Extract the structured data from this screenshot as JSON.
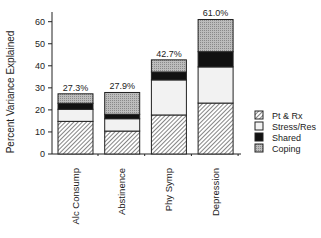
{
  "chart_data": {
    "type": "bar",
    "stacked": true,
    "title": "",
    "xlabel": "",
    "ylabel": "Percent Variance Explained",
    "ylim": [
      0,
      65
    ],
    "yticks": [
      0,
      10,
      20,
      30,
      40,
      50,
      60
    ],
    "ytick_labels": [
      "0",
      "10",
      "20",
      "30",
      "40",
      "50",
      "60"
    ],
    "grid": false,
    "legend_position": "right",
    "categories": [
      "Alc Consump",
      "Abstinence",
      "Phy Symp",
      "Depression"
    ],
    "totals_labels": [
      "27.3%",
      "27.9%",
      "42.7%",
      "61.0%"
    ],
    "totals": [
      27.3,
      27.9,
      42.7,
      61.0
    ],
    "series": [
      {
        "name": "Pt & Rx",
        "pattern": "hatch",
        "values": [
          14.8,
          10.4,
          17.7,
          23.1
        ]
      },
      {
        "name": "Stress/Res",
        "pattern": "light",
        "values": [
          5.5,
          5.6,
          15.9,
          16.4
        ]
      },
      {
        "name": "Shared",
        "pattern": "black",
        "values": [
          2.7,
          2.0,
          3.6,
          6.9
        ]
      },
      {
        "name": "Coping",
        "pattern": "gray",
        "values": [
          4.3,
          9.9,
          5.5,
          14.6
        ]
      }
    ]
  }
}
